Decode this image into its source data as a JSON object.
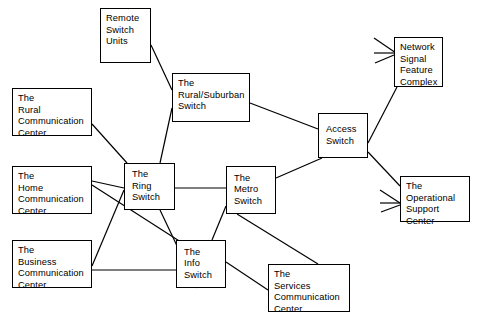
{
  "diagram": {
    "type": "node-link-diagram",
    "canvas": {
      "width": 482,
      "height": 328,
      "background": "#ffffff"
    },
    "style": {
      "node_border": "#000000",
      "node_fill": "#ffffff",
      "edge_color": "#000000",
      "text_color": "#000000"
    },
    "nodes": [
      {
        "id": "remote_switch_units",
        "label": "Remote\nSwitch\nUnits",
        "x": 100,
        "y": 8,
        "w": 51,
        "h": 55,
        "align": "top"
      },
      {
        "id": "rural_suburban_switch",
        "label": "The\nRural/Suburban\nSwitch",
        "x": 172,
        "y": 73,
        "w": 78,
        "h": 49,
        "align": "top"
      },
      {
        "id": "rural_communication_center",
        "label": "The\nRural\nCommunication\nCenter",
        "x": 12,
        "y": 88,
        "w": 80,
        "h": 48,
        "align": "top"
      },
      {
        "id": "home_communication_center",
        "label": "The\nHome\nCommunication\nCenter",
        "x": 12,
        "y": 166,
        "w": 80,
        "h": 48,
        "align": "top"
      },
      {
        "id": "business_communication_center",
        "label": "The\nBusiness\nCommunication\nCenter",
        "x": 12,
        "y": 240,
        "w": 80,
        "h": 48,
        "align": "top"
      },
      {
        "id": "ring_switch",
        "label": "The\nRing\nSwitch",
        "x": 124,
        "y": 163,
        "w": 51,
        "h": 47,
        "align": "center"
      },
      {
        "id": "metro_switch",
        "label": "The\nMetro\nSwitch",
        "x": 226,
        "y": 166,
        "w": 50,
        "h": 48,
        "align": "center"
      },
      {
        "id": "info_switch",
        "label": "The\nInfo\nSwitch",
        "x": 176,
        "y": 240,
        "w": 50,
        "h": 48,
        "align": "center"
      },
      {
        "id": "access_switch",
        "label": "Access\nSwitch",
        "x": 318,
        "y": 113,
        "w": 50,
        "h": 45,
        "align": "center"
      },
      {
        "id": "network_signal_feature_complex",
        "label": "Network\nSignal\nFeature\nComplex",
        "x": 394,
        "y": 37,
        "w": 49,
        "h": 50,
        "align": "top"
      },
      {
        "id": "operational_support_center",
        "label": "The\nOperational\nSupport\nCenter",
        "x": 400,
        "y": 176,
        "w": 70,
        "h": 46,
        "align": "top"
      },
      {
        "id": "services_communication_center",
        "label": "The\nServices\nCommunication\nCenter",
        "x": 268,
        "y": 264,
        "w": 82,
        "h": 48,
        "align": "top"
      }
    ],
    "edges": [
      {
        "from": "remote_switch_units",
        "to": "rural_suburban_switch",
        "x1": 151,
        "y1": 45,
        "x2": 172,
        "y2": 90
      },
      {
        "from": "ring_switch",
        "to": "rural_suburban_switch",
        "x1": 160,
        "y1": 163,
        "x2": 172,
        "y2": 108
      },
      {
        "from": "rural_suburban_switch",
        "to": "access_switch",
        "x1": 250,
        "y1": 103,
        "x2": 318,
        "y2": 129
      },
      {
        "from": "rural_communication_center",
        "to": "ring_switch",
        "x1": 92,
        "y1": 124,
        "x2": 127,
        "y2": 163
      },
      {
        "from": "home_communication_center",
        "to": "ring_switch",
        "x1": 92,
        "y1": 181,
        "x2": 124,
        "y2": 188
      },
      {
        "from": "home_communication_center",
        "to": "info_switch",
        "x1": 92,
        "y1": 185,
        "x2": 226,
        "y2": 271
      },
      {
        "from": "business_communication_center",
        "to": "ring_switch",
        "x1": 92,
        "y1": 266,
        "x2": 124,
        "y2": 190
      },
      {
        "from": "business_communication_center",
        "to": "info_switch",
        "x1": 92,
        "y1": 270,
        "x2": 226,
        "y2": 270
      },
      {
        "from": "ring_switch",
        "to": "metro_switch",
        "x1": 175,
        "y1": 188,
        "x2": 226,
        "y2": 188
      },
      {
        "from": "ring_switch",
        "to": "info_switch",
        "x1": 160,
        "y1": 210,
        "x2": 197,
        "y2": 288
      },
      {
        "from": "metro_switch",
        "to": "info_switch",
        "x1": 226,
        "y1": 206,
        "x2": 212,
        "y2": 240
      },
      {
        "from": "metro_switch",
        "to": "access_switch",
        "x1": 276,
        "y1": 178,
        "x2": 322,
        "y2": 158
      },
      {
        "from": "metro_switch",
        "to": "services_communication_center",
        "x1": 237,
        "y1": 214,
        "x2": 318,
        "y2": 264
      },
      {
        "from": "info_switch",
        "to": "services_communication_center",
        "x1": 226,
        "y1": 262,
        "x2": 268,
        "y2": 290
      },
      {
        "from": "access_switch",
        "to": "network_signal_feature_complex",
        "x1": 368,
        "y1": 143,
        "x2": 397,
        "y2": 87
      },
      {
        "from": "access_switch",
        "to": "operational_support_center",
        "x1": 368,
        "y1": 152,
        "x2": 400,
        "y2": 186
      }
    ],
    "feeder_lines": [
      {
        "target": "network_signal_feature_complex",
        "x1": 374,
        "y1": 38,
        "x2": 396,
        "y2": 53
      },
      {
        "target": "network_signal_feature_complex",
        "x1": 374,
        "y1": 53,
        "x2": 394,
        "y2": 53
      },
      {
        "target": "network_signal_feature_complex",
        "x1": 375,
        "y1": 63,
        "x2": 394,
        "y2": 55
      },
      {
        "target": "operational_support_center",
        "x1": 380,
        "y1": 190,
        "x2": 400,
        "y2": 203
      },
      {
        "target": "operational_support_center",
        "x1": 380,
        "y1": 203,
        "x2": 400,
        "y2": 203
      },
      {
        "target": "operational_support_center",
        "x1": 381,
        "y1": 212,
        "x2": 400,
        "y2": 205
      }
    ]
  }
}
